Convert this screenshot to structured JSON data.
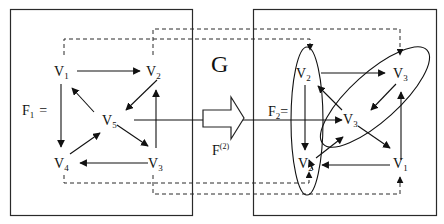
{
  "colors": {
    "stroke": "#2a2a2a",
    "background": "#ffffff"
  },
  "transformation": {
    "label": "G",
    "arrow_label": "F",
    "arrow_superscript": "(2)"
  },
  "left_graph": {
    "name_main": "F",
    "name_sub": "1",
    "equals": "=",
    "vertices": [
      {
        "id": "v1",
        "main": "V",
        "sub": "1"
      },
      {
        "id": "v2",
        "main": "V",
        "sub": "2"
      },
      {
        "id": "v3",
        "main": "V",
        "sub": "3"
      },
      {
        "id": "v4",
        "main": "V",
        "sub": "4"
      },
      {
        "id": "v5",
        "main": "V",
        "sub": "5"
      }
    ],
    "edges": [
      [
        "V1",
        "V2"
      ],
      [
        "V1",
        "V4"
      ],
      [
        "V2",
        "V5"
      ],
      [
        "V3",
        "V2"
      ],
      [
        "V3",
        "V4"
      ],
      [
        "V4",
        "V5"
      ],
      [
        "V5",
        "V1"
      ],
      [
        "V5",
        "V3"
      ]
    ]
  },
  "right_graph": {
    "name_main": "F",
    "name_sub": "2",
    "equals": "=",
    "vertices": [
      {
        "id": "r-v2-top",
        "main": "V",
        "sub": "2"
      },
      {
        "id": "r-v3-top",
        "main": "V",
        "sub": "3"
      },
      {
        "id": "r-v3-mid",
        "main": "V",
        "sub": "3"
      },
      {
        "id": "r-v2-bot",
        "main": "V",
        "sub": "2"
      },
      {
        "id": "r-v1",
        "main": "V",
        "sub": "1"
      }
    ],
    "clusters": [
      "V2 ellipse (vertical)",
      "V3 ellipse (diagonal)"
    ]
  }
}
